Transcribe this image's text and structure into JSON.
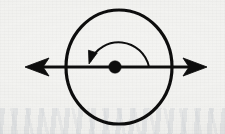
{
  "figure": {
    "background_color": "#f4f4f2",
    "ink_color": "#111111",
    "canvas": {
      "width": 225,
      "height": 134
    }
  },
  "elements": {
    "body_circle": {
      "name": "body-circle",
      "center_x": 119,
      "center_y": 67,
      "radius_x": 53,
      "radius_y": 57,
      "stroke_width": 3.2,
      "fill": "none"
    },
    "axis_line": {
      "name": "axis-line",
      "start_x": 25,
      "end_x": 207,
      "y": 67,
      "stroke_width": 3.0,
      "arrowheads": "both",
      "arrowhead_style": "swept-barbed",
      "arrowhead_length": 24,
      "arrowhead_half_height": 9
    },
    "center_dot": {
      "name": "center-point-dot",
      "cx": 115,
      "cy": 67,
      "radius": 6.2
    },
    "rotation_arc": {
      "name": "rotation-direction-arc",
      "center_x": 118,
      "center_y": 67,
      "radius": 31,
      "start_angle_deg": 0,
      "end_angle_deg": 180,
      "direction": "counterclockwise",
      "stroke_width": 2.0,
      "arrow_end": "left",
      "arrow_tip_x": 89,
      "arrow_tip_y": 64,
      "arrow_half_width": 4.6,
      "arrow_length": 13
    }
  },
  "labels": {
    "axis_label": "",
    "rotation_label": "",
    "center_label": ""
  }
}
